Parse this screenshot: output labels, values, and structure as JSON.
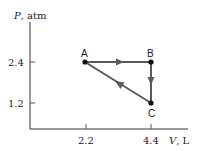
{
  "diagram": {
    "type": "PV diagram",
    "y_axis": {
      "var": "P",
      "unit": ", atm",
      "ticks": [
        {
          "label": "2.4",
          "value": 2.4
        },
        {
          "label": "1.2",
          "value": 1.2
        }
      ]
    },
    "x_axis": {
      "var": "V",
      "unit": ", L",
      "ticks": [
        {
          "label": "2.2",
          "value": 2.2
        },
        {
          "label": "4.4",
          "value": 4.4
        }
      ]
    },
    "points": [
      {
        "label": "A",
        "V": 2.2,
        "P": 2.4
      },
      {
        "label": "B",
        "V": 4.4,
        "P": 2.4
      },
      {
        "label": "C",
        "V": 4.4,
        "P": 1.2
      }
    ],
    "paths": [
      {
        "from": "A",
        "to": "B"
      },
      {
        "from": "B",
        "to": "C"
      },
      {
        "from": "C",
        "to": "A"
      }
    ],
    "colors": {
      "path": "#5a5a5a",
      "axis": "#333333",
      "point": "#111111"
    }
  }
}
